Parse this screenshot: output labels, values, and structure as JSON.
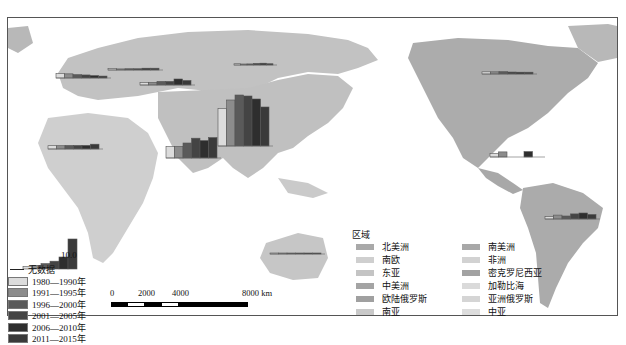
{
  "map": {
    "type": "world map with inset bar charts per region",
    "land_color": "#c8c8c8",
    "frame_color": "#555555"
  },
  "chart_data": {
    "type": "bar",
    "title": "",
    "reference_value_label": "10.0",
    "periods": [
      "1980—1990年",
      "1991—1995年",
      "1996—2000年",
      "2001—2005年",
      "2006—2010年",
      "2011—2015年"
    ],
    "period_colors": [
      "#dcdcdc",
      "#8c8c8c",
      "#5a5a5a",
      "#444444",
      "#2e2e2e",
      "#3a3a3a"
    ],
    "series": [
      {
        "name": "东亚",
        "values": [
          7.5,
          9.2,
          10.2,
          10.0,
          9.4,
          7.8
        ]
      },
      {
        "name": "南亚",
        "values": [
          3.8,
          3.9,
          5.0,
          6.6,
          5.8,
          6.8
        ]
      },
      {
        "name": "南欧",
        "values": [
          2.8,
          2.6,
          2.1,
          1.9,
          1.5,
          1.2
        ]
      },
      {
        "name": "欧陆俄罗斯",
        "values": [
          0.8,
          0.6,
          0.7,
          0.7,
          1.0,
          1.0
        ]
      },
      {
        "name": "亚洲俄罗斯",
        "values": [
          0.7,
          0.5,
          0.6,
          0.9,
          1.0,
          0.7
        ]
      },
      {
        "name": "中亚",
        "values": [
          0.8,
          0.9,
          1.2,
          1.2,
          2.0,
          1.5
        ]
      },
      {
        "name": "密克罗尼西亚",
        "values": [
          0.1,
          0.2,
          0.4,
          0.7,
          0.9,
          1.5
        ]
      },
      {
        "name": "非洲",
        "values": [
          1.1,
          1.1,
          1.2,
          1.2,
          1.2,
          1.6
        ]
      },
      {
        "name": "北美洲",
        "values": [
          1.2,
          1.2,
          1.3,
          1.1,
          1.0,
          1.0
        ]
      },
      {
        "name": "中美洲",
        "values": [
          1.2,
          1.7,
          0,
          0,
          1.8,
          0
        ]
      },
      {
        "name": "南美洲",
        "values": [
          0.8,
          1.3,
          1.0,
          1.7,
          2.0,
          1.5
        ]
      },
      {
        "name": "大洋洲",
        "values": [
          0.1,
          0.1,
          0.1,
          0.2,
          0.2,
          0.1
        ]
      }
    ],
    "ylim": [
      0,
      10
    ],
    "legend_position": "bottom-left"
  },
  "period_legend": {
    "no_data_label": "无数据",
    "items": [
      {
        "label": "1980—1990年",
        "color": "#dcdcdc"
      },
      {
        "label": "1991—1995年",
        "color": "#8c8c8c"
      },
      {
        "label": "1996—2000年",
        "color": "#5a5a5a"
      },
      {
        "label": "2001—2005年",
        "color": "#444444"
      },
      {
        "label": "2006—2010年",
        "color": "#2e2e2e"
      },
      {
        "label": "2011—2015年",
        "color": "#3a3a3a"
      }
    ]
  },
  "region_legend": {
    "title": "区域",
    "left_column": [
      {
        "label": "北美洲",
        "color": "#a9a9a9"
      },
      {
        "label": "南欧",
        "color": "#cfcfcf"
      },
      {
        "label": "东亚",
        "color": "#c4c4c4"
      },
      {
        "label": "中美洲",
        "color": "#a4a4a4"
      },
      {
        "label": "欧陆俄罗斯",
        "color": "#a0a0a0"
      },
      {
        "label": "南亚",
        "color": "#c9c9c9"
      }
    ],
    "right_column": [
      {
        "label": "南美洲",
        "color": "#a8a8a8"
      },
      {
        "label": "非洲",
        "color": "#d2d2d2"
      },
      {
        "label": "密克罗尼西亚",
        "color": "#a2a2a2"
      },
      {
        "label": "加勒比海",
        "color": "#dadada"
      },
      {
        "label": "亚洲俄罗斯",
        "color": "#d5d5d5"
      },
      {
        "label": "中亚",
        "color": "#dddddd"
      }
    ]
  },
  "scale_bar": {
    "labels": [
      "0",
      "2000",
      "4000",
      "8000 km"
    ]
  }
}
